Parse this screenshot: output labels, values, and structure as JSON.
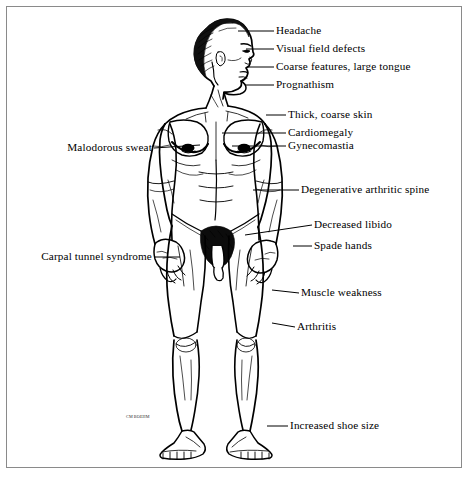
{
  "figure": {
    "style": "black and white pen-and-ink line art",
    "background_color": "#ffffff",
    "ink_color": "#000000",
    "frame_color": "#8a8a8a",
    "artist_signature": "CM BOEHM"
  },
  "annotations": {
    "right_side": [
      {
        "id": "headache",
        "label": "Headache",
        "label_x": 276,
        "label_y": 31,
        "leader_from_x": 238,
        "leader_from_y": 31,
        "leader_to_x": 274,
        "leader_to_y": 31
      },
      {
        "id": "visual-field-defects",
        "label": "Visual field defects",
        "label_x": 276,
        "label_y": 49,
        "leader_from_x": 246,
        "leader_from_y": 49,
        "leader_to_x": 274,
        "leader_to_y": 49
      },
      {
        "id": "coarse-features",
        "label": "Coarse features, large tongue",
        "label_x": 276,
        "label_y": 67,
        "leader_from_x": 248,
        "leader_from_y": 67,
        "leader_to_x": 274,
        "leader_to_y": 67
      },
      {
        "id": "prognathism",
        "label": "Prognathism",
        "label_x": 276,
        "label_y": 85,
        "leader_from_x": 245,
        "leader_from_y": 85,
        "leader_to_x": 274,
        "leader_to_y": 85
      },
      {
        "id": "thick-coarse-skin",
        "label": "Thick, coarse skin",
        "label_x": 288,
        "label_y": 115,
        "leader_from_x": 266,
        "leader_from_y": 115,
        "leader_to_x": 286,
        "leader_to_y": 115
      },
      {
        "id": "cardiomegaly",
        "label": "Cardiomegaly",
        "label_x": 288,
        "label_y": 133,
        "leader_from_x": 222,
        "leader_from_y": 133,
        "leader_to_x": 286,
        "leader_to_y": 133
      },
      {
        "id": "gynecomastia",
        "label": "Gynecomastia",
        "label_x": 288,
        "label_y": 146,
        "leader_from_x": 232,
        "leader_from_y": 146,
        "leader_to_x": 286,
        "leader_to_y": 146
      },
      {
        "id": "degenerative-spine",
        "label": "Degenerative arthritic spine",
        "label_x": 301,
        "label_y": 190,
        "leader_from_x": 253,
        "leader_from_y": 190,
        "leader_to_x": 299,
        "leader_to_y": 190
      },
      {
        "id": "decreased-libido",
        "label": "Decreased libido",
        "label_x": 314,
        "label_y": 225,
        "leader_from_x": 245,
        "leader_from_y": 235,
        "leader_to_x": 312,
        "leader_to_y": 225
      },
      {
        "id": "spade-hands",
        "label": "Spade hands",
        "label_x": 314,
        "label_y": 246,
        "leader_from_x": 293,
        "leader_from_y": 246,
        "leader_to_x": 312,
        "leader_to_y": 246
      },
      {
        "id": "muscle-weakness",
        "label": "Muscle weakness",
        "label_x": 301,
        "label_y": 293,
        "leader_from_x": 272,
        "leader_from_y": 290,
        "leader_to_x": 299,
        "leader_to_y": 293
      },
      {
        "id": "arthritis",
        "label": "Arthritis",
        "label_x": 297,
        "label_y": 327,
        "leader_from_x": 272,
        "leader_from_y": 323,
        "leader_to_x": 295,
        "leader_to_y": 327
      },
      {
        "id": "increased-shoe-size",
        "label": "Increased shoe size",
        "label_x": 290,
        "label_y": 426,
        "leader_from_x": 267,
        "leader_from_y": 426,
        "leader_to_x": 288,
        "leader_to_y": 426
      }
    ],
    "left_side": [
      {
        "id": "malodorous-sweat",
        "label": "Malodorous sweat",
        "label_right_x": 152,
        "label_y": 148,
        "leader_from_x": 200,
        "leader_from_y": 145,
        "leader_to_x": 154,
        "leader_to_y": 148
      },
      {
        "id": "carpal-tunnel-syndrome",
        "label": "Carpal tunnel syndrome",
        "label_right_x": 152,
        "label_y": 257,
        "leader_from_x": 180,
        "leader_from_y": 257,
        "leader_to_x": 154,
        "leader_to_y": 257
      }
    ]
  }
}
